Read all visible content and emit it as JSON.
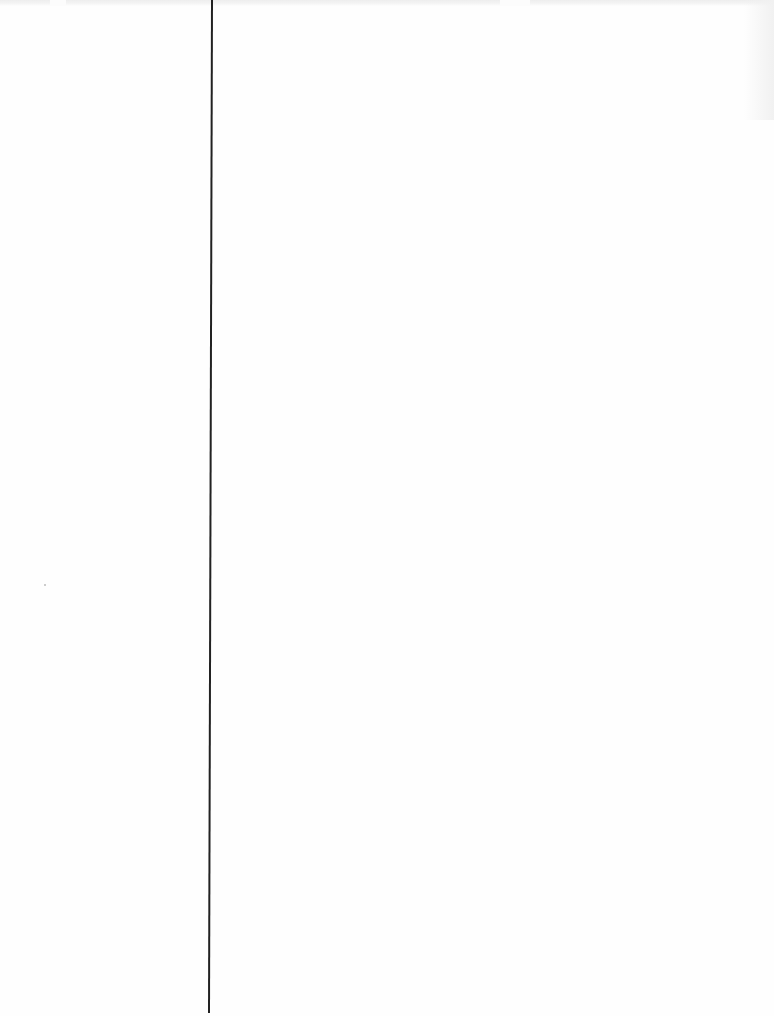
{
  "document": {
    "type": "scanned-page",
    "content": "",
    "elements": {
      "vertical_rule": {
        "color": "#222222",
        "x_top": 211,
        "x_bottom": 215,
        "y_start": 0,
        "y_end": 1013
      },
      "top_bleed_through": {
        "legible": false
      }
    },
    "colors": {
      "paper": "#fefefe",
      "rule": "#222222"
    }
  }
}
